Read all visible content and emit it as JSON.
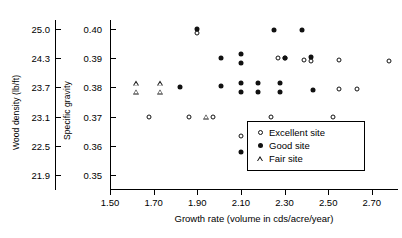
{
  "chart_data": {
    "type": "scatter",
    "title": "",
    "xlabel": "Growth rate (volume in cds/acre/year)",
    "ylabel": "Specific gravity",
    "ylabel_secondary": "Wood density (lb/ft)",
    "xlim": [
      1.5,
      2.82
    ],
    "ylim": [
      0.345,
      0.403
    ],
    "grid": false,
    "legend_position": "lower-right-inside",
    "xticks": [
      1.5,
      1.7,
      1.9,
      2.1,
      2.3,
      2.5,
      2.7
    ],
    "xticklabels": [
      "1.50",
      "1.70",
      "1.90",
      "2.10",
      "2.30",
      "2.50",
      "2.70"
    ],
    "yticks": [
      0.35,
      0.36,
      0.37,
      0.38,
      0.39,
      0.4
    ],
    "yticklabels": [
      "0.35",
      "0.36",
      "0.37",
      "0.38",
      "0.39",
      "0.40"
    ],
    "yticks_secondary": [
      21.9,
      22.5,
      23.1,
      23.7,
      24.3,
      25.0
    ],
    "yticklabels_secondary": [
      "21.9",
      "22.5",
      "23.1",
      "23.7",
      "24.3",
      "25.0"
    ],
    "series": [
      {
        "name": "Excellent site",
        "marker": "open-circle",
        "color": "#111111",
        "points": [
          [
            1.9,
            0.3985
          ],
          [
            2.27,
            0.39
          ],
          [
            2.3,
            0.39
          ],
          [
            2.39,
            0.3895
          ],
          [
            2.55,
            0.3895
          ],
          [
            2.78,
            0.389
          ],
          [
            2.42,
            0.389
          ],
          [
            2.55,
            0.3795
          ],
          [
            2.63,
            0.3795
          ],
          [
            1.68,
            0.37
          ],
          [
            1.86,
            0.37
          ],
          [
            1.97,
            0.37
          ],
          [
            2.24,
            0.37
          ],
          [
            2.52,
            0.37
          ],
          [
            2.1,
            0.3635
          ]
        ]
      },
      {
        "name": "Good site",
        "marker": "filled-circle",
        "color": "#111111",
        "points": [
          [
            1.9,
            0.4
          ],
          [
            2.25,
            0.3995
          ],
          [
            2.38,
            0.3995
          ],
          [
            2.01,
            0.39
          ],
          [
            2.1,
            0.3915
          ],
          [
            2.1,
            0.3885
          ],
          [
            2.3,
            0.39
          ],
          [
            2.42,
            0.3905
          ],
          [
            1.82,
            0.38
          ],
          [
            2.01,
            0.3805
          ],
          [
            2.1,
            0.3815
          ],
          [
            2.1,
            0.3785
          ],
          [
            2.18,
            0.3815
          ],
          [
            2.18,
            0.3785
          ],
          [
            2.28,
            0.3815
          ],
          [
            2.28,
            0.3785
          ],
          [
            2.43,
            0.379
          ],
          [
            2.1,
            0.358
          ]
        ]
      },
      {
        "name": "Fair site",
        "marker": "open-triangle",
        "color": "#111111",
        "points": [
          [
            1.62,
            0.3815
          ],
          [
            1.62,
            0.3785
          ],
          [
            1.73,
            0.3815
          ],
          [
            1.73,
            0.3785
          ],
          [
            1.94,
            0.37
          ]
        ]
      }
    ]
  },
  "legend": {
    "items": [
      {
        "label": "Excellent site",
        "marker": "open-circle"
      },
      {
        "label": "Good site",
        "marker": "filled-circle"
      },
      {
        "label": "Fair site",
        "marker": "open-triangle"
      }
    ]
  }
}
